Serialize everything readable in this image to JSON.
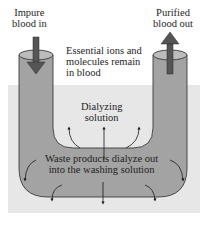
{
  "diagram": {
    "type": "dialysis-u-tube",
    "colors": {
      "background": "#ffffff",
      "dialyzing_bath": "#e7e7e7",
      "tube_fill": "#a3a3a3",
      "tube_top": "#b9b9b9",
      "tube_outline": "#3a3a3a",
      "flow_arrow": "#4a4a4a",
      "diffusion_arrow": "#1a1a1a"
    },
    "labels": {
      "inlet": [
        "Impure",
        "blood in"
      ],
      "outlet": [
        "Purified",
        "blood out"
      ],
      "retained": [
        "Essential ions and",
        "molecules remain",
        "in blood"
      ],
      "bath": [
        "Dialyzing",
        "solution"
      ],
      "waste": [
        "Waste products dialyze out",
        "into the washing solution"
      ]
    },
    "arrows": {
      "inlet_direction": "down",
      "outlet_direction": "up",
      "diffusion_out_count": 8
    }
  }
}
